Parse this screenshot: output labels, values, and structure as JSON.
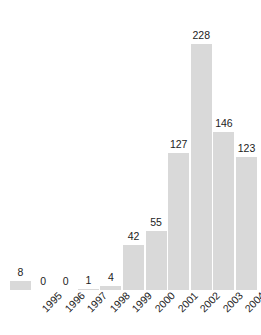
{
  "chart_data": {
    "type": "bar",
    "title": "",
    "subtitle": "",
    "xlabel": "",
    "ylabel": "",
    "categories": [
      "1995",
      "1996",
      "1997",
      "1998",
      "1999",
      "2000",
      "2001",
      "2002",
      "2003",
      "2004",
      "2005"
    ],
    "values": [
      8,
      0,
      0,
      1,
      4,
      42,
      55,
      127,
      228,
      146,
      123
    ],
    "value_labels": [
      "8",
      "0",
      "0",
      "1",
      "4",
      "42",
      "55",
      "127",
      "228",
      "146",
      "123"
    ],
    "ylim": [
      0,
      228
    ],
    "grid": false,
    "legend": false,
    "legend_position": "none",
    "bar_color": "#d9d9d9",
    "background_color": "#ffffff",
    "text_color": "#1c1c1c",
    "tick_label_rotation": -45,
    "value_labels_shown": true,
    "axis_lines_shown": false
  }
}
